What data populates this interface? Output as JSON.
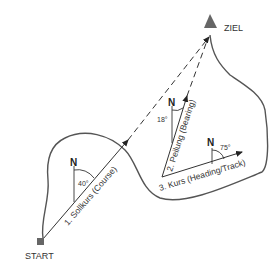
{
  "diagram": {
    "start_label": "START",
    "goal_label": "ZIEL",
    "north_label": "N",
    "course": {
      "label": "1. Sollkurs (Course)",
      "angle": "40°"
    },
    "bearing": {
      "label": "2. Peilung (Bearing)",
      "angle": "18°"
    },
    "heading": {
      "label": "3. Kurs (Heading/Track)",
      "angle": "75°"
    },
    "colors": {
      "line": "#333333",
      "path": "#555555",
      "marker": "#666666"
    }
  }
}
